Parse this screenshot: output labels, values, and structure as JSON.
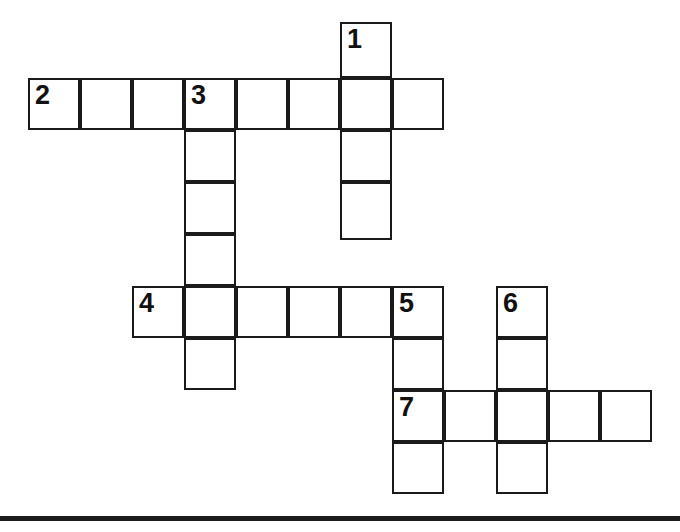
{
  "puzzle": {
    "title": "Crossword Grid",
    "type": "crossword-grid",
    "background_color": "#ffffff",
    "line_color": "#1a1a1a",
    "number_color": "#111111",
    "canvas": {
      "width": 680,
      "height": 532
    },
    "geometry": {
      "cell_size": 52,
      "origin_x": 28,
      "origin_y": 22,
      "line_width": 2,
      "columns_x": [
        28,
        80,
        132,
        184,
        236,
        288,
        340,
        392,
        444,
        496,
        548,
        600,
        652
      ],
      "rows_y": [
        22,
        74,
        126,
        178,
        230,
        286,
        338,
        390,
        442,
        494
      ]
    },
    "numbered_entries": [
      {
        "number": "1",
        "direction": "down",
        "length": 4,
        "col": 6,
        "row": 0
      },
      {
        "number": "2",
        "direction": "across",
        "length": 8,
        "col": 0,
        "row": 1
      },
      {
        "number": "3",
        "direction": "down",
        "length": 6,
        "col": 3,
        "row": 1
      },
      {
        "number": "4",
        "direction": "across",
        "length": 6,
        "col": 2,
        "row": 5
      },
      {
        "number": "5",
        "direction": "down",
        "length": 4,
        "col": 7,
        "row": 5
      },
      {
        "number": "6",
        "direction": "down",
        "length": 4,
        "col": 9,
        "row": 5
      },
      {
        "number": "7",
        "direction": "across",
        "length": 5,
        "col": 7,
        "row": 7
      }
    ],
    "cells": [
      {
        "id": "c-1-0",
        "x": 340,
        "y": 22,
        "w": 52,
        "h": 56,
        "number": "1"
      },
      {
        "id": "c-2-0",
        "x": 28,
        "y": 78,
        "w": 52,
        "h": 52,
        "number": "2"
      },
      {
        "id": "c-2-1",
        "x": 80,
        "y": 78,
        "w": 52,
        "h": 52,
        "number": ""
      },
      {
        "id": "c-2-2",
        "x": 132,
        "y": 78,
        "w": 52,
        "h": 52,
        "number": ""
      },
      {
        "id": "c-2-3",
        "x": 184,
        "y": 78,
        "w": 52,
        "h": 52,
        "number": "3"
      },
      {
        "id": "c-2-4",
        "x": 236,
        "y": 78,
        "w": 52,
        "h": 52,
        "number": ""
      },
      {
        "id": "c-2-5",
        "x": 288,
        "y": 78,
        "w": 52,
        "h": 52,
        "number": ""
      },
      {
        "id": "c-2-6",
        "x": 340,
        "y": 78,
        "w": 52,
        "h": 52,
        "number": ""
      },
      {
        "id": "c-2-7",
        "x": 392,
        "y": 78,
        "w": 52,
        "h": 52,
        "number": ""
      },
      {
        "id": "c-1-2",
        "x": 340,
        "y": 130,
        "w": 52,
        "h": 52,
        "number": ""
      },
      {
        "id": "c-1-3",
        "x": 340,
        "y": 182,
        "w": 52,
        "h": 58,
        "number": ""
      },
      {
        "id": "c-3-1",
        "x": 184,
        "y": 130,
        "w": 52,
        "h": 52,
        "number": ""
      },
      {
        "id": "c-3-2",
        "x": 184,
        "y": 182,
        "w": 52,
        "h": 52,
        "number": ""
      },
      {
        "id": "c-3-3",
        "x": 184,
        "y": 234,
        "w": 52,
        "h": 52,
        "number": ""
      },
      {
        "id": "c-3-4",
        "x": 184,
        "y": 286,
        "w": 52,
        "h": 52,
        "number": ""
      },
      {
        "id": "c-3-5",
        "x": 184,
        "y": 338,
        "w": 52,
        "h": 52,
        "number": ""
      },
      {
        "id": "c-4-0",
        "x": 132,
        "y": 286,
        "w": 52,
        "h": 52,
        "number": "4"
      },
      {
        "id": "c-4-2",
        "x": 236,
        "y": 286,
        "w": 52,
        "h": 52,
        "number": ""
      },
      {
        "id": "c-4-3",
        "x": 288,
        "y": 286,
        "w": 52,
        "h": 52,
        "number": ""
      },
      {
        "id": "c-4-4",
        "x": 340,
        "y": 286,
        "w": 52,
        "h": 52,
        "number": ""
      },
      {
        "id": "c-5-0",
        "x": 392,
        "y": 286,
        "w": 52,
        "h": 52,
        "number": "5"
      },
      {
        "id": "c-5-1",
        "x": 392,
        "y": 338,
        "w": 52,
        "h": 52,
        "number": ""
      },
      {
        "id": "c-5-3",
        "x": 392,
        "y": 442,
        "w": 52,
        "h": 52,
        "number": ""
      },
      {
        "id": "c-6-0",
        "x": 496,
        "y": 286,
        "w": 52,
        "h": 52,
        "number": "6"
      },
      {
        "id": "c-6-1",
        "x": 496,
        "y": 338,
        "w": 52,
        "h": 52,
        "number": ""
      },
      {
        "id": "c-6-3",
        "x": 496,
        "y": 442,
        "w": 52,
        "h": 52,
        "number": ""
      },
      {
        "id": "c-7-0",
        "x": 392,
        "y": 390,
        "w": 52,
        "h": 52,
        "number": "7"
      },
      {
        "id": "c-7-1",
        "x": 444,
        "y": 390,
        "w": 52,
        "h": 52,
        "number": ""
      },
      {
        "id": "c-7-2",
        "x": 496,
        "y": 390,
        "w": 52,
        "h": 52,
        "number": ""
      },
      {
        "id": "c-7-3",
        "x": 548,
        "y": 390,
        "w": 52,
        "h": 52,
        "number": ""
      },
      {
        "id": "c-7-4",
        "x": 600,
        "y": 390,
        "w": 52,
        "h": 52,
        "number": ""
      }
    ],
    "page_rule": {
      "x": 0,
      "y": 516,
      "w": 680,
      "h": 5
    }
  }
}
